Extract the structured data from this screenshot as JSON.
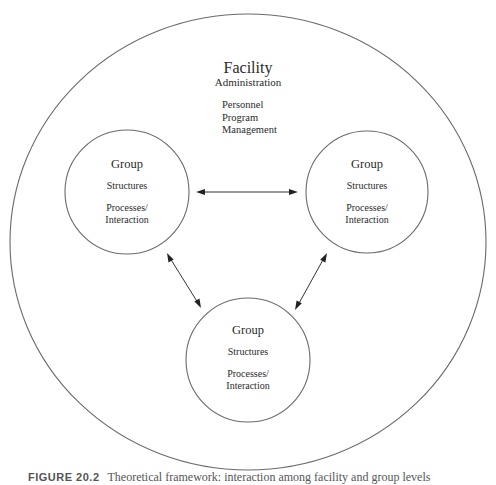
{
  "facility": {
    "title": "Facility",
    "subtitle": "Administration",
    "items": [
      "Personnel",
      "Program",
      "Management"
    ]
  },
  "groups": [
    {
      "title": "Group",
      "structures": "Structures",
      "processes_line1": "Processes/",
      "processes_line2": "Interaction"
    },
    {
      "title": "Group",
      "structures": "Structures",
      "processes_line1": "Processes/",
      "processes_line2": "Interaction"
    },
    {
      "title": "Group",
      "structures": "Structures",
      "processes_line1": "Processes/",
      "processes_line2": "Interaction"
    }
  ],
  "connections": [
    {
      "from": "group-left",
      "to": "group-right",
      "type": "bidirectional"
    },
    {
      "from": "group-left",
      "to": "group-bottom",
      "type": "bidirectional"
    },
    {
      "from": "group-right",
      "to": "group-bottom",
      "type": "bidirectional"
    }
  ],
  "caption": {
    "figure_number": "FIGURE 20.2",
    "text": "Theoretical framework: interaction among facility and group levels"
  },
  "colors": {
    "circle_stroke": "#6a6a6a",
    "arrow": "#222222",
    "text": "#2a2a2a",
    "background": "#ffffff"
  }
}
